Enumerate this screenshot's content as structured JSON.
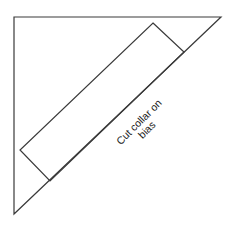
{
  "diagram": {
    "label_line1": "Cut collar on",
    "label_line2": "bias",
    "colors": {
      "stroke": "#3a3a3a",
      "text": "#222222",
      "background": "#ffffff"
    }
  }
}
